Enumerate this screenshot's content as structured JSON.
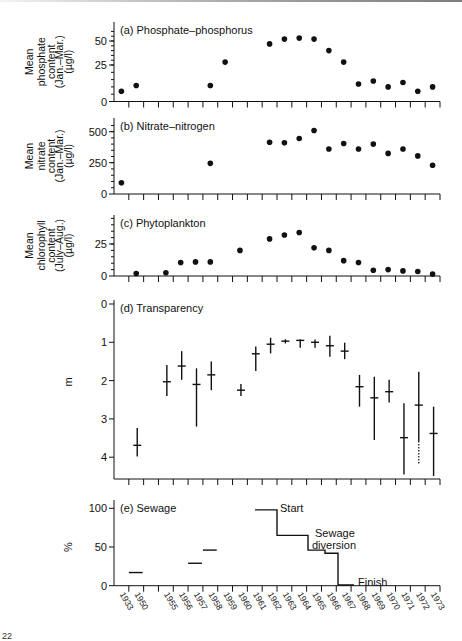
{
  "figure": {
    "x_axis": {
      "tick_labels": [
        "1933",
        "1950",
        "",
        "1955",
        "1956",
        "1957",
        "1958",
        "1959",
        "1960",
        "1961",
        "1962",
        "1963",
        "1964",
        "1965",
        "1966",
        "1967",
        "1968",
        "1969",
        "1970",
        "1971",
        "1972",
        "1973"
      ],
      "x_start": 114,
      "x_end": 440
    },
    "page_number_fragment": "22"
  },
  "chart_data": [
    {
      "id": "a",
      "type": "scatter",
      "title": "(a) Phosphate–phosphorus",
      "ylabel_lines": [
        "Mean",
        "phosphate",
        "content",
        "(Jan.–Mar.)",
        "(µg/l)"
      ],
      "yticks": [
        0,
        25,
        50
      ],
      "ylim": [
        0,
        60
      ],
      "x": [
        "1933",
        "1950",
        "1958",
        "1959",
        "1962",
        "1963",
        "1964",
        "1965",
        "1966",
        "1967",
        "1968",
        "1969",
        "1970",
        "1971",
        "1972",
        "1973"
      ],
      "values": [
        7,
        11,
        11,
        28,
        47,
        52,
        53,
        52,
        40,
        28,
        12,
        14,
        10,
        13,
        7,
        10
      ]
    },
    {
      "id": "b",
      "type": "scatter",
      "title": "(b) Nitrate–nitrogen",
      "ylabel_lines": [
        "Mean",
        "nitrate",
        "content",
        "(Jan.–Mar.)",
        "(µg/l)"
      ],
      "yticks": [
        0,
        250,
        500
      ],
      "ylim": [
        0,
        580
      ],
      "x": [
        "1933",
        "1958",
        "1962",
        "1963",
        "1964",
        "1965",
        "1966",
        "1967",
        "1968",
        "1969",
        "1970",
        "1971",
        "1972",
        "1973"
      ],
      "values": [
        90,
        245,
        415,
        410,
        445,
        510,
        360,
        405,
        360,
        400,
        325,
        360,
        305,
        230
      ]
    },
    {
      "id": "c",
      "type": "scatter",
      "title": "(c) Phytoplankton",
      "ylabel_lines": [
        "Mean",
        "chlorophyll",
        "content",
        "(July–Aug.)",
        "(µg/l)"
      ],
      "yticks": [
        0,
        25
      ],
      "ylim": [
        0,
        45
      ],
      "x": [
        "1950",
        "1955",
        "1956",
        "1957",
        "1958",
        "1960",
        "1962",
        "1963",
        "1964",
        "1965",
        "1966",
        "1967",
        "1968",
        "1969",
        "1970",
        "1971",
        "1972",
        "1973"
      ],
      "values": [
        2,
        2.5,
        10.5,
        11,
        11,
        20,
        29,
        32,
        34,
        22,
        20,
        12,
        10.5,
        4.5,
        5,
        4,
        3.5,
        1.5
      ]
    },
    {
      "id": "d",
      "type": "errorbar",
      "title": "(d) Transparency",
      "ylabel": "m",
      "yticks": [
        0,
        1,
        2,
        3,
        4
      ],
      "ylim": [
        0,
        4.6
      ],
      "y_inverted": true,
      "x": [
        "1950",
        "1955",
        "1956",
        "1957",
        "1958",
        "1960",
        "1961",
        "1962",
        "1963",
        "1964",
        "1965",
        "1966",
        "1967",
        "1968",
        "1969",
        "1970",
        "1971",
        "1972",
        "1973"
      ],
      "mean": [
        3.69,
        2.03,
        1.62,
        2.1,
        1.85,
        2.25,
        1.3,
        1.05,
        0.97,
        0.95,
        1.0,
        1.09,
        1.23,
        2.16,
        2.45,
        2.29,
        3.49,
        2.64,
        3.38
      ],
      "min": [
        3.24,
        1.59,
        1.23,
        1.68,
        1.5,
        2.09,
        1.11,
        0.88,
        0.92,
        0.92,
        0.93,
        0.83,
        1.01,
        1.85,
        1.9,
        1.98,
        2.59,
        1.77,
        2.68
      ],
      "max": [
        3.98,
        2.4,
        1.98,
        3.2,
        2.25,
        2.4,
        1.75,
        1.29,
        1.03,
        1.14,
        1.14,
        1.38,
        1.44,
        2.68,
        3.55,
        2.57,
        4.45,
        3.58,
        4.49
      ],
      "dotted_extension": {
        "x": "1972",
        "from": 3.58,
        "to": 4.2
      }
    },
    {
      "id": "e",
      "type": "line",
      "title": "(e) Sewage",
      "ylabel": "%",
      "yticks": [
        0,
        50,
        100
      ],
      "ylim": [
        0,
        110
      ],
      "segments": [
        {
          "x_from": "1950",
          "x_to": "1950",
          "value": 17
        },
        {
          "x_from": "1957",
          "x_to": "1957",
          "value": 29
        },
        {
          "x_from": "1958",
          "x_to": "1958",
          "value": 46
        }
      ],
      "step_series": {
        "points_x": [
          255,
          277,
          277,
          308,
          308,
          325,
          325,
          338,
          338,
          354
        ],
        "values": [
          98,
          98,
          65,
          65,
          46,
          46,
          42,
          42,
          1,
          1
        ]
      },
      "annotations": [
        {
          "text": "Start",
          "x": 280,
          "value": 100
        },
        {
          "text": "Sewage",
          "x": 315,
          "value": 68
        },
        {
          "text": "diversion",
          "x": 312,
          "value": 52
        },
        {
          "text": "Finish",
          "x": 358,
          "value": 5
        }
      ]
    }
  ]
}
